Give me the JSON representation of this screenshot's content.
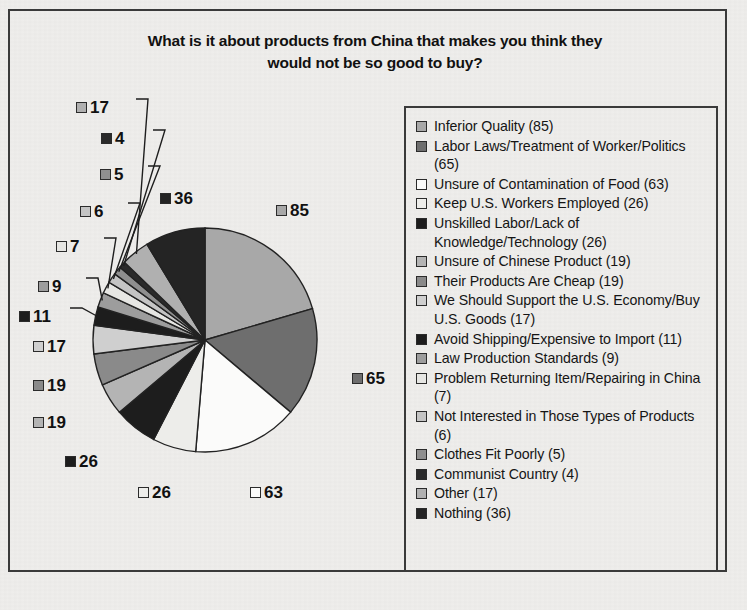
{
  "chart_data": {
    "type": "pie",
    "title": "What is it about products from China that makes you think they would not be so good to buy?",
    "xlabel": "",
    "ylabel": "",
    "legend_position": "right",
    "grid": false,
    "categories": [
      "Inferior Quality",
      "Labor Laws/Treatment of Worker/Politics",
      "Unsure of Contamination of Food",
      "Keep U.S. Workers Employed",
      "Unskilled Labor/Lack of Knowledge/Technology",
      "Unsure of Chinese Product",
      "Their Products Are Cheap",
      "We Should Support the U.S. Economy/Buy U.S. Goods",
      "Avoid Shipping/Expensive to Import",
      "Law Production Standards",
      "Problem Returning Item/Repairing in China",
      "Not Interested in Those Types of Products",
      "Clothes Fit Poorly",
      "Communist Country",
      "Other",
      "Nothing"
    ],
    "values": [
      85,
      65,
      63,
      26,
      26,
      19,
      19,
      17,
      11,
      9,
      7,
      6,
      5,
      4,
      17,
      36
    ],
    "colors": [
      "#a8a8a8",
      "#6e6e6e",
      "#fbfbfa",
      "#ededea",
      "#1d1d1d",
      "#b4b4b4",
      "#8a8a8a",
      "#cfcfcf",
      "#1d1d1d",
      "#9d9d9d",
      "#e6e6e3",
      "#c4c4c4",
      "#8f8f8f",
      "#2a2a2a",
      "#b0b0b0",
      "#242424"
    ]
  },
  "title": {
    "line1": "What is it about products from China that makes you think they",
    "line2": "would not be so good to buy?"
  },
  "pie_labels": [
    {
      "value": "85",
      "swatch": "#a8a8a8"
    },
    {
      "value": "65",
      "swatch": "#6e6e6e"
    },
    {
      "value": "63",
      "swatch": "#fbfbfa"
    },
    {
      "value": "26",
      "swatch": "#ededea"
    },
    {
      "value": "26",
      "swatch": "#1d1d1d"
    },
    {
      "value": "19",
      "swatch": "#b4b4b4"
    },
    {
      "value": "19",
      "swatch": "#8a8a8a"
    },
    {
      "value": "17",
      "swatch": "#cfcfcf"
    },
    {
      "value": "11",
      "swatch": "#1d1d1d"
    },
    {
      "value": "9",
      "swatch": "#9d9d9d"
    },
    {
      "value": "7",
      "swatch": "#e6e6e3"
    },
    {
      "value": "6",
      "swatch": "#c4c4c4"
    },
    {
      "value": "5",
      "swatch": "#8f8f8f"
    },
    {
      "value": "4",
      "swatch": "#2a2a2a"
    },
    {
      "value": "17",
      "swatch": "#b0b0b0"
    },
    {
      "value": "36",
      "swatch": "#242424"
    }
  ],
  "legend": {
    "items": [
      {
        "label": "Inferior Quality (85)",
        "swatch": "#a8a8a8"
      },
      {
        "label": "Labor Laws/Treatment of Worker/Politics (65)",
        "swatch": "#6e6e6e"
      },
      {
        "label": "Unsure of Contamination of Food (63)",
        "swatch": "#fbfbfa"
      },
      {
        "label": "Keep U.S. Workers Employed (26)",
        "swatch": "#ededea"
      },
      {
        "label": "Unskilled Labor/Lack of Knowledge/Technology (26)",
        "swatch": "#1d1d1d"
      },
      {
        "label": "Unsure of Chinese Product (19)",
        "swatch": "#b4b4b4"
      },
      {
        "label": "Their Products Are Cheap (19)",
        "swatch": "#8a8a8a"
      },
      {
        "label": "We Should Support the U.S. Economy/Buy U.S. Goods (17)",
        "swatch": "#cfcfcf"
      },
      {
        "label": "Avoid Shipping/Expensive to Import (11)",
        "swatch": "#1d1d1d"
      },
      {
        "label": "Law Production Standards (9)",
        "swatch": "#9d9d9d"
      },
      {
        "label": "Problem Returning Item/Repairing in China (7)",
        "swatch": "#e6e6e3"
      },
      {
        "label": "Not Interested in Those Types of Products (6)",
        "swatch": "#c4c4c4"
      },
      {
        "label": "Clothes Fit Poorly (5)",
        "swatch": "#8f8f8f"
      },
      {
        "label": "Communist Country (4)",
        "swatch": "#2a2a2a"
      },
      {
        "label": "Other (17)",
        "swatch": "#b0b0b0"
      },
      {
        "label": "Nothing (36)",
        "swatch": "#242424"
      }
    ]
  }
}
